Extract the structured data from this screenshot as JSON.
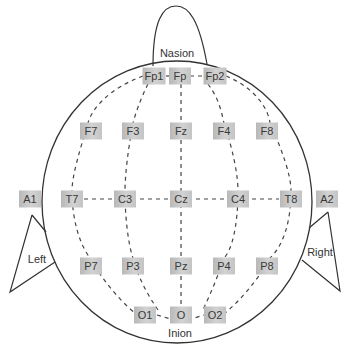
{
  "diagram": {
    "landmarks": {
      "nasion": "Nasion",
      "inion": "Inion",
      "left": "Left",
      "right": "Right"
    },
    "colors": {
      "outline": "#333333",
      "dashed_line": "#444444",
      "electrode_fill": "#c8c8c8",
      "electrode_text": "#3a3a3a"
    },
    "electrodes": [
      {
        "id": "Fp1",
        "label": "Fp1",
        "x": 154,
        "y": 76
      },
      {
        "id": "Fp",
        "label": "Fp",
        "x": 180,
        "y": 76
      },
      {
        "id": "Fp2",
        "label": "Fp2",
        "x": 215,
        "y": 76
      },
      {
        "id": "F7",
        "label": "F7",
        "x": 91,
        "y": 131
      },
      {
        "id": "F3",
        "label": "F3",
        "x": 133,
        "y": 131
      },
      {
        "id": "Fz",
        "label": "Fz",
        "x": 181,
        "y": 131
      },
      {
        "id": "F4",
        "label": "F4",
        "x": 224,
        "y": 131
      },
      {
        "id": "F8",
        "label": "F8",
        "x": 267,
        "y": 131
      },
      {
        "id": "A1",
        "label": "A1",
        "x": 30,
        "y": 199
      },
      {
        "id": "T7",
        "label": "T7",
        "x": 72,
        "y": 199
      },
      {
        "id": "C3",
        "label": "C3",
        "x": 125,
        "y": 199
      },
      {
        "id": "Cz",
        "label": "Cz",
        "x": 181,
        "y": 199
      },
      {
        "id": "C4",
        "label": "C4",
        "x": 238,
        "y": 199
      },
      {
        "id": "T8",
        "label": "T8",
        "x": 291,
        "y": 199
      },
      {
        "id": "A2",
        "label": "A2",
        "x": 327,
        "y": 199
      },
      {
        "id": "P7",
        "label": "P7",
        "x": 91,
        "y": 266
      },
      {
        "id": "P3",
        "label": "P3",
        "x": 133,
        "y": 266
      },
      {
        "id": "Pz",
        "label": "Pz",
        "x": 181,
        "y": 266
      },
      {
        "id": "P4",
        "label": "P4",
        "x": 224,
        "y": 266
      },
      {
        "id": "P8",
        "label": "P8",
        "x": 267,
        "y": 266
      },
      {
        "id": "O1",
        "label": "O1",
        "x": 145,
        "y": 315
      },
      {
        "id": "O",
        "label": "O",
        "x": 181,
        "y": 315
      },
      {
        "id": "O2",
        "label": "O2",
        "x": 215,
        "y": 315
      }
    ]
  }
}
